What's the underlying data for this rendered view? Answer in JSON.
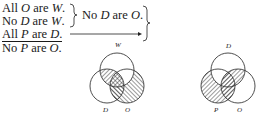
{
  "syllogism": {
    "premise1": {
      "pre": "All ",
      "t1": "O",
      "mid": " are ",
      "t2": "W",
      "post": "."
    },
    "premise2": {
      "pre": "No ",
      "t1": "D",
      "mid": " are ",
      "t2": "W",
      "post": "."
    },
    "intermediate": {
      "pre": "No ",
      "t1": "D",
      "mid": " are ",
      "t2": "O",
      "post": "."
    },
    "premise3": {
      "pre": "All ",
      "t1": "P",
      "mid": " are ",
      "t2": "D",
      "post": "."
    },
    "conclusion": {
      "pre": "No ",
      "t1": "P",
      "mid": " are ",
      "t2": "O",
      "post": "."
    }
  },
  "venn1": {
    "top": "W",
    "left": "D",
    "right": "O"
  },
  "venn2": {
    "top": "D",
    "left": "P",
    "right": "O"
  }
}
